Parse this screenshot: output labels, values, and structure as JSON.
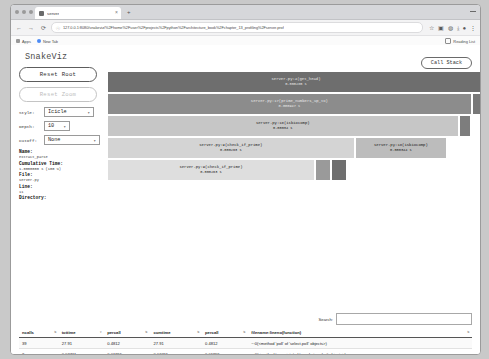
{
  "browser": {
    "tab_title": "server",
    "tab_close_icon": "close-icon",
    "new_tab_icon": "plus-icon",
    "back_icon": "arrow-left-icon",
    "forward_icon": "arrow-right-icon",
    "reload_icon": "reload-icon",
    "lock_icon": "page-info-icon",
    "url": "127.0.0.1:8080/snakeviz/%2Fhome%2Fuser%2Fprojects%2Fpython%2Farchitecture_book%2Fchapter_13_profiling%2Fserver.prof",
    "toolbar_icons": [
      "star-icon",
      "extensions-icon",
      "profile-icon",
      "download-icon",
      "account-icon",
      "menu-icon"
    ],
    "bookmarks": [
      {
        "label": "Apps",
        "icon": "apps-icon"
      },
      {
        "label": "New Tab",
        "icon": "globe-icon"
      }
    ],
    "reading_list": {
      "label": "Reading List",
      "icon": "reading-list-icon"
    },
    "window_minimize_icon": "minimize-icon"
  },
  "app": {
    "title": "SnakeViz",
    "call_stack_label": "Call Stack"
  },
  "controls": {
    "reset_root_label": "Reset Root",
    "reset_zoom_label": "Reset Zoom",
    "style": {
      "label": "Style:",
      "value": "Icicle"
    },
    "depth": {
      "label": "Depth:",
      "value": "10"
    },
    "cutoff": {
      "label": "Cutoff:",
      "value": "None"
    }
  },
  "details": {
    "name_key": "Name:",
    "name_value": "extract_parse",
    "cumtime_key": "Cumulative Time:",
    "cumtime_value": "1.0000000 s (100 %)",
    "file_key": "File:",
    "file_value": "server.py",
    "line_key": "Line:",
    "line_value": "11",
    "directory_key": "Directory:",
    "directory_value": ""
  },
  "chart_data": {
    "type": "bar",
    "unit": "s",
    "frames": [
      {
        "name": "server.py:4(get_head)",
        "time": "0.000285 s",
        "depth": 0,
        "x_pct": 0.0,
        "w_pct": 100.0,
        "shade": "#6e6e6e",
        "dark": true
      },
      {
        "name": "server.py:17(prime_numbers_up_to)",
        "time": "0.000947 s",
        "depth": 1,
        "x_pct": 0.0,
        "w_pct": 96.5,
        "shade": "#8c8c8c",
        "dark": true
      },
      {
        "name": "server.py:17(right-edge)",
        "time": "",
        "depth": 1,
        "x_pct": 96.5,
        "w_pct": 3.5,
        "shade": "#787878",
        "dark": true
      },
      {
        "name": "server.py:18(isbiocomp)",
        "time": "0.00034 s",
        "depth": 2,
        "x_pct": 0.0,
        "w_pct": 93.0,
        "shade": "#c6c6c6",
        "dark": false
      },
      {
        "name": "server.py:18(right-edge)",
        "time": "",
        "depth": 2,
        "x_pct": 93.0,
        "w_pct": 3.3,
        "shade": "#7d7d7d",
        "dark": true
      },
      {
        "name": "server.py:9(check_if_prime)",
        "time": "0.000263 s",
        "depth": 3,
        "x_pct": 0.0,
        "w_pct": 65.5,
        "shade": "#d4d4d4",
        "dark": false
      },
      {
        "name": "server.py:18(isbiocomp)",
        "time": "0.000344 s",
        "depth": 3,
        "x_pct": 65.5,
        "w_pct": 24.5,
        "shade": "#bcbcbc",
        "dark": false
      },
      {
        "name": "server.py:9(check_if_prime)",
        "time": "0.000263 s",
        "depth": 4,
        "x_pct": 0.0,
        "w_pct": 55.0,
        "shade": "#dedede",
        "dark": false
      },
      {
        "name": "leaf-frame-a",
        "time": "",
        "depth": 4,
        "x_pct": 55.0,
        "w_pct": 4.3,
        "shade": "#9a9a9a",
        "dark": true
      },
      {
        "name": "leaf-frame-b",
        "time": "",
        "depth": 4,
        "x_pct": 59.3,
        "w_pct": 4.3,
        "shade": "#6f6f6f",
        "dark": true
      }
    ]
  },
  "table": {
    "search_label": "Search:",
    "search_value": "",
    "search_placeholder": "",
    "columns": [
      "ncalls",
      "tottime",
      "percall",
      "cumtime",
      "percall",
      "filename:lineno(function)"
    ],
    "rows": [
      [
        "39",
        "27.91",
        "0.4812",
        "27.91",
        "0.4812",
        "~:0(<method 'poll' of 'select.poll' objects>)"
      ],
      [
        "2",
        "0.03711",
        "0.01855",
        "0.03711",
        "0.01855",
        "~:0(<method 'recv_into' of '_socket.socket' objects>)"
      ]
    ]
  }
}
